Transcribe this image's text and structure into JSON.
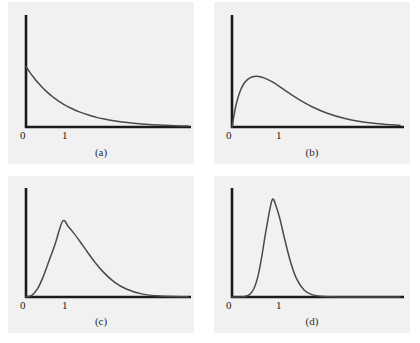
{
  "figure": {
    "axis_color": "#1a1a1a",
    "curve_color": "#4a4a4a",
    "panel_background": "#f1f1f1",
    "page_background": "#ffffff"
  },
  "chart_data": [
    {
      "type": "line",
      "panel": "a",
      "caption": "(a)",
      "title": "",
      "xlabel": "",
      "ylabel": "",
      "xticks": [
        0,
        1
      ],
      "xticklabels": [
        "0",
        "1"
      ],
      "yticks": [],
      "yticklabels": [],
      "grid": false,
      "legend": "none",
      "xlim": [
        0,
        4.2
      ],
      "ylim": [
        0,
        1.15
      ],
      "shape_parameter": 1,
      "peak_x": 0,
      "peak_y": 0.62,
      "x": [
        0.0,
        0.1,
        0.2,
        0.3,
        0.4,
        0.5,
        0.6,
        0.7,
        0.8,
        0.9,
        1.0,
        1.2,
        1.4,
        1.6,
        1.8,
        2.0,
        2.4,
        2.8,
        3.2,
        3.6,
        4.0,
        4.2
      ],
      "y": [
        0.62,
        0.561,
        0.508,
        0.459,
        0.416,
        0.376,
        0.34,
        0.308,
        0.279,
        0.252,
        0.228,
        0.187,
        0.153,
        0.125,
        0.102,
        0.084,
        0.056,
        0.038,
        0.025,
        0.017,
        0.011,
        0.009
      ]
    },
    {
      "type": "line",
      "panel": "b",
      "caption": "(b)",
      "title": "",
      "xlabel": "",
      "ylabel": "",
      "xticks": [
        0,
        1
      ],
      "xticklabels": [
        "0",
        "1"
      ],
      "yticks": [],
      "yticklabels": [],
      "grid": false,
      "legend": "none",
      "xlim": [
        0,
        4.2
      ],
      "ylim": [
        0,
        1.15
      ],
      "shape_parameter": 2,
      "peak_x": 0.62,
      "peak_y": 0.52,
      "x": [
        0.0,
        0.1,
        0.2,
        0.3,
        0.4,
        0.5,
        0.62,
        0.7,
        0.8,
        0.9,
        1.0,
        1.2,
        1.4,
        1.6,
        1.8,
        2.0,
        2.4,
        2.8,
        3.2,
        3.6,
        4.0,
        4.2
      ],
      "y": [
        0.0,
        0.225,
        0.365,
        0.447,
        0.492,
        0.514,
        0.52,
        0.516,
        0.504,
        0.486,
        0.465,
        0.412,
        0.356,
        0.302,
        0.252,
        0.208,
        0.139,
        0.09,
        0.057,
        0.036,
        0.022,
        0.017
      ]
    },
    {
      "type": "line",
      "panel": "c",
      "caption": "(c)",
      "title": "",
      "xlabel": "",
      "ylabel": "",
      "xticks": [
        0,
        1
      ],
      "xticklabels": [
        "0",
        "1"
      ],
      "yticks": [],
      "yticklabels": [],
      "grid": false,
      "legend": "none",
      "xlim": [
        0,
        4.2
      ],
      "ylim": [
        0,
        1.15
      ],
      "shape_parameter": 5,
      "peak_x": 0.95,
      "peak_y": 0.8,
      "x": [
        0.0,
        0.15,
        0.3,
        0.45,
        0.6,
        0.75,
        0.95,
        1.1,
        1.25,
        1.4,
        1.6,
        1.8,
        2.0,
        2.3,
        2.6,
        3.0,
        3.4,
        3.8,
        4.2
      ],
      "y": [
        0.0,
        0.018,
        0.088,
        0.218,
        0.385,
        0.552,
        0.8,
        0.742,
        0.669,
        0.586,
        0.47,
        0.36,
        0.265,
        0.155,
        0.085,
        0.033,
        0.012,
        0.004,
        0.002
      ]
    },
    {
      "type": "line",
      "panel": "d",
      "caption": "(d)",
      "title": "",
      "xlabel": "",
      "ylabel": "",
      "xticks": [
        0,
        1
      ],
      "xticklabels": [
        "0",
        "1"
      ],
      "yticks": [],
      "yticklabels": [],
      "grid": false,
      "legend": "none",
      "xlim": [
        0,
        4.2
      ],
      "ylim": [
        0,
        1.15
      ],
      "shape_parameter": 20,
      "peak_x": 1.0,
      "peak_y": 1.02,
      "x": [
        0.0,
        0.3,
        0.45,
        0.55,
        0.65,
        0.75,
        0.85,
        1.0,
        1.1,
        1.2,
        1.3,
        1.45,
        1.6,
        1.8,
        2.0,
        2.3,
        2.6,
        3.0,
        3.4,
        3.8,
        4.2
      ],
      "y": [
        0.0,
        0.004,
        0.03,
        0.09,
        0.22,
        0.44,
        0.7,
        1.02,
        0.96,
        0.82,
        0.64,
        0.39,
        0.205,
        0.075,
        0.025,
        0.005,
        0.001,
        0.0,
        0.0,
        0.0,
        0.0
      ]
    }
  ]
}
